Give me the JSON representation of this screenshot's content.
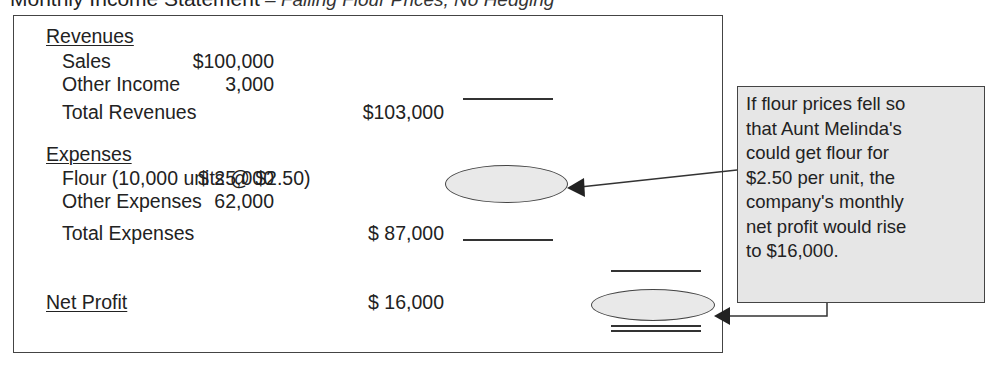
{
  "title": {
    "main": "Monthly Income Statement",
    "subtitle": " – Falling Flour Prices, No Hedging"
  },
  "statement": {
    "revenues_header": "Revenues",
    "revenue_items": [
      {
        "label": "Sales",
        "amount": "$100,000"
      },
      {
        "label": "Other Income",
        "amount": "3,000"
      }
    ],
    "total_revenues": {
      "label": "Total Revenues",
      "amount": "$103,000"
    },
    "expenses_header": "Expenses",
    "expense_items": [
      {
        "label": "Flour (10,000 units @ $2.50)",
        "amount": "$  25,000",
        "highlighted": true
      },
      {
        "label": "Other Expenses",
        "amount": "62,000"
      }
    ],
    "total_expenses": {
      "label": "Total Expenses",
      "amount": "$ 87,000"
    },
    "net_profit": {
      "label": "Net Profit",
      "amount": "$  16,000",
      "highlighted": true
    }
  },
  "callout": {
    "lines": [
      "If flour prices fell so",
      "that Aunt Melinda's",
      "could get flour for",
      "$2.50 per unit, the",
      "company's monthly",
      "net profit would rise",
      "to $16,000."
    ],
    "background": "#e6e6e6"
  }
}
